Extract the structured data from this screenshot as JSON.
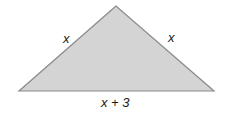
{
  "figure": {
    "shape": "isosceles-triangle",
    "fill_color": "#d4d4d4",
    "stroke_color": "#8a8a8a",
    "vertices": {
      "apex": [
        116,
        6
      ],
      "base_left": [
        19,
        91
      ],
      "base_right": [
        214,
        91
      ]
    },
    "labels": {
      "left_side": "x",
      "right_side": "x",
      "base": "x + 3"
    }
  }
}
